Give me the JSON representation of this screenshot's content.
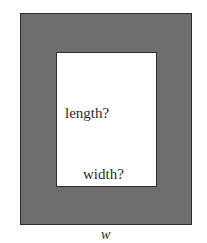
{
  "diagram": {
    "outer_label": "w",
    "inner_length_label": "length?",
    "inner_width_label": "width?",
    "colors": {
      "border_fill": "#6e6e6e",
      "inner_fill": "#ffffff",
      "outline": "#2e2e2e"
    }
  }
}
